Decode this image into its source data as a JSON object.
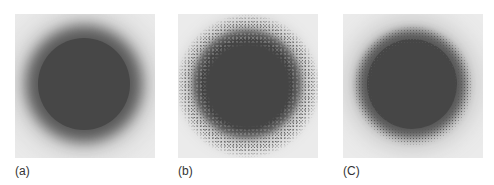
{
  "figure": {
    "panels": [
      {
        "label": "(a)",
        "description": "dark gray disk with smooth blurred edge on light gray background"
      },
      {
        "label": "(b)",
        "description": "dark gray disk with noisy, grainy scattered edge on light gray background"
      },
      {
        "label": "(C)",
        "description": "dark gray disk with soft blurred edge and slight grain on light gray background"
      }
    ],
    "colors": {
      "background": "#ebebeb",
      "disk": "#464646"
    }
  }
}
